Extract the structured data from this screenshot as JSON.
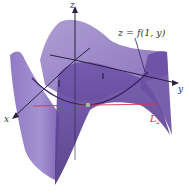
{
  "figure": {
    "type": "3d-surface-plot",
    "labels": {
      "z_axis": "z",
      "x_axis": "x",
      "y_axis": "y",
      "curve": "z = f(1, y)",
      "line": "L",
      "line_subscript": "2",
      "tick_x": "1",
      "tick_y": "1"
    },
    "colors": {
      "surface_light": "#9b86c6",
      "surface_mid": "#7e62b3",
      "surface_dark": "#5a3d8f",
      "axes": "#2a2040",
      "curve": "#3b2466",
      "line_L2": "#d8334a",
      "point": "#a8b8a0"
    }
  }
}
